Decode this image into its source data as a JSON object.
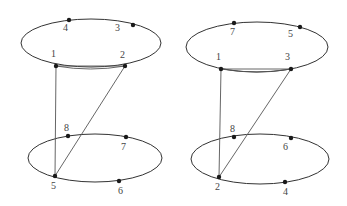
{
  "diagrams": [
    {
      "id": "left",
      "top_ellipse": {
        "cx": 91,
        "cy": 43,
        "rx": 70,
        "ry": 24
      },
      "bottom_ellipse": {
        "cx": 95,
        "cy": 158,
        "rx": 67,
        "ry": 24
      },
      "nodes": [
        {
          "label": "4",
          "x": 69,
          "y": 20,
          "lx": 63,
          "ly": 31
        },
        {
          "label": "3",
          "x": 133,
          "y": 25,
          "lx": 115,
          "ly": 31
        },
        {
          "label": "1",
          "x": 56,
          "y": 66,
          "lx": 51,
          "ly": 57
        },
        {
          "label": "2",
          "x": 125,
          "y": 66,
          "lx": 120,
          "ly": 58
        },
        {
          "label": "8",
          "x": 68,
          "y": 136,
          "lx": 64,
          "ly": 131
        },
        {
          "label": "7",
          "x": 126,
          "y": 137,
          "lx": 121,
          "ly": 150
        },
        {
          "label": "5",
          "x": 55,
          "y": 176,
          "lx": 51,
          "ly": 189
        },
        {
          "label": "6",
          "x": 119,
          "y": 181,
          "lx": 118,
          "ly": 194
        }
      ],
      "double_edge": {
        "from": "1",
        "to": "2"
      },
      "edges": [
        {
          "from": "1",
          "to": "5"
        },
        {
          "from": "2",
          "to": "5"
        }
      ]
    },
    {
      "id": "right",
      "top_ellipse": {
        "cx": 257,
        "cy": 47,
        "rx": 71,
        "ry": 25
      },
      "bottom_ellipse": {
        "cx": 260,
        "cy": 159,
        "rx": 69,
        "ry": 25
      },
      "nodes": [
        {
          "label": "7",
          "x": 234,
          "y": 23,
          "lx": 230,
          "ly": 35
        },
        {
          "label": "5",
          "x": 300,
          "y": 27,
          "lx": 288,
          "ly": 37
        },
        {
          "label": "1",
          "x": 221,
          "y": 69,
          "lx": 216,
          "ly": 60
        },
        {
          "label": "3",
          "x": 291,
          "y": 69,
          "lx": 285,
          "ly": 60
        },
        {
          "label": "8",
          "x": 234,
          "y": 137,
          "lx": 230,
          "ly": 132
        },
        {
          "label": "6",
          "x": 291,
          "y": 138,
          "lx": 283,
          "ly": 150
        },
        {
          "label": "2",
          "x": 219,
          "y": 177,
          "lx": 215,
          "ly": 190
        },
        {
          "label": "4",
          "x": 285,
          "y": 182,
          "lx": 283,
          "ly": 195
        }
      ],
      "double_edge": {
        "from": "1",
        "to": "3"
      },
      "edges": [
        {
          "from": "1",
          "to": "2"
        },
        {
          "from": "3",
          "to": "2"
        }
      ]
    }
  ]
}
